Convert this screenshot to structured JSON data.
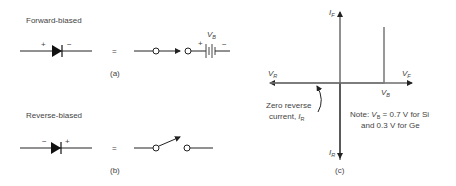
{
  "panel_a": {
    "title": "Forward-biased",
    "anode_sign": "+",
    "cathode_sign": "−",
    "equals": "=",
    "battery_label_main": "V",
    "battery_label_sub": "B",
    "battery_plus": "+",
    "battery_minus": "−",
    "caption": "(a)"
  },
  "panel_b": {
    "title": "Reverse-biased",
    "cathode_sign": "−",
    "anode_sign": "+",
    "equals": "=",
    "caption": "(b)"
  },
  "panel_c": {
    "y_pos_label_main": "I",
    "y_pos_label_sub": "F",
    "y_neg_label_main": "I",
    "y_neg_label_sub": "R",
    "x_neg_label_main": "V",
    "x_neg_label_sub": "R",
    "x_pos_label_main": "V",
    "x_pos_label_sub": "F",
    "vb_label_main": "V",
    "vb_label_sub": "B",
    "annotation_line1": "Zero reverse",
    "annotation_line2": "current, ",
    "annotation_i_main": "I",
    "annotation_i_sub": "R",
    "note_line1_prefix": "Note: ",
    "note_vb_main": "V",
    "note_vb_sub": "B",
    "note_line1_suffix": " = 0.7 V for Si",
    "note_line2": "and 0.3 V for Ge",
    "caption": "(c)",
    "trace_color": "#777777"
  }
}
